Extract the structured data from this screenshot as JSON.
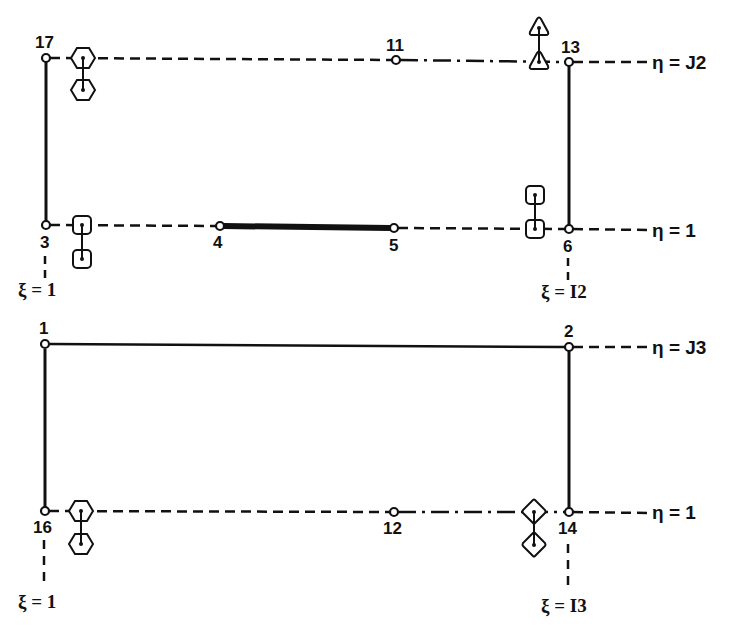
{
  "colors": {
    "ink": "#111111",
    "background": "#ffffff"
  },
  "blocks": [
    {
      "id": "upper",
      "nodes": [
        {
          "id": "17",
          "label": "17"
        },
        {
          "id": "11",
          "label": "11"
        },
        {
          "id": "13",
          "label": "13"
        },
        {
          "id": "3",
          "label": "3"
        },
        {
          "id": "4",
          "label": "4"
        },
        {
          "id": "5",
          "label": "5"
        },
        {
          "id": "6",
          "label": "6"
        }
      ],
      "line_labels": {
        "top": "η = J2",
        "bottom": "η = 1",
        "left": "ξ = 1",
        "right": "ξ = I2"
      },
      "markers": [
        {
          "shape": "hexagon",
          "near_node": "17",
          "row": "top"
        },
        {
          "shape": "triangle",
          "near_node": "13",
          "row": "top"
        },
        {
          "shape": "square",
          "near_node": "3",
          "row": "bottom"
        },
        {
          "shape": "square",
          "near_node": "6",
          "row": "bottom"
        }
      ]
    },
    {
      "id": "lower",
      "nodes": [
        {
          "id": "1",
          "label": "1"
        },
        {
          "id": "2",
          "label": "2"
        },
        {
          "id": "16",
          "label": "16"
        },
        {
          "id": "12",
          "label": "12"
        },
        {
          "id": "14",
          "label": "14"
        }
      ],
      "line_labels": {
        "top": "η = J3",
        "bottom": "η = 1",
        "left": "ξ = 1",
        "right": "ξ = I3"
      },
      "markers": [
        {
          "shape": "hexagon",
          "near_node": "16",
          "row": "bottom"
        },
        {
          "shape": "diamond",
          "near_node": "14",
          "row": "bottom"
        }
      ]
    }
  ]
}
